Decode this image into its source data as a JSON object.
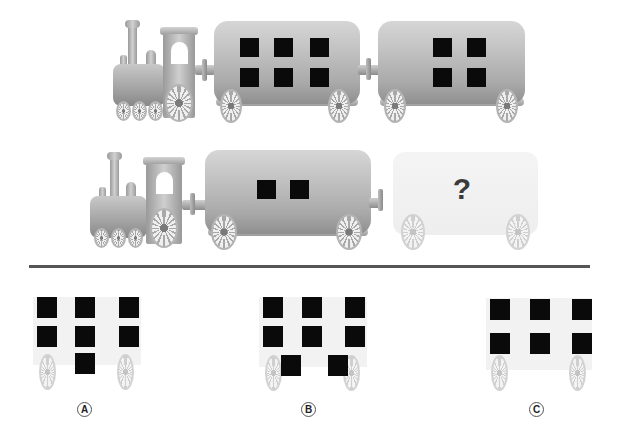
{
  "puzzle": {
    "type": "train window pattern",
    "row1": {
      "locomotive": true,
      "cars": [
        {
          "window_count": 6,
          "layout": "2 rows x 3"
        },
        {
          "window_count": 4,
          "layout": "2 rows x 2"
        }
      ]
    },
    "row2": {
      "locomotive": true,
      "cars": [
        {
          "window_count": 2,
          "layout": "1 row x 2"
        },
        {
          "window_count": null,
          "unknown": true,
          "symbol": "?"
        }
      ]
    },
    "options": [
      {
        "label": "A",
        "window_count": 7,
        "layout": "3 + 3 + 1"
      },
      {
        "label": "B",
        "window_count": 8,
        "layout": "3 + 3 + 2"
      },
      {
        "label": "C",
        "window_count": 6,
        "layout": "3 + 3"
      }
    ]
  },
  "colors": {
    "window": "#0a0a0a",
    "car_body": "#b5b5b5",
    "divider": "#555555",
    "question_mark": "#3a3a3a"
  }
}
